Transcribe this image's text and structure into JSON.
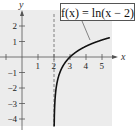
{
  "chart_data": {
    "type": "line",
    "title": "",
    "function_label": "f(x) = ln(x − 2)",
    "xlabel": "x",
    "ylabel": "y",
    "x_ticks": [
      1,
      2,
      3,
      4,
      5
    ],
    "y_ticks": [
      2,
      1,
      -1,
      -2,
      -3,
      -4
    ],
    "x_tick_labels": [
      "1",
      "2",
      "3",
      "4",
      "5"
    ],
    "y_tick_labels": [
      "2",
      "1",
      "−1",
      "−2",
      "−3",
      "−4"
    ],
    "xlim": [
      -1.3,
      5.6
    ],
    "ylim": [
      -4.5,
      3.0
    ],
    "asymptote": {
      "x": 2,
      "style": "dashed"
    },
    "grid": false,
    "series": [
      {
        "name": "f(x) = ln(x − 2)",
        "x": [
          2.011,
          2.05,
          2.1,
          2.2,
          2.4,
          2.6,
          3,
          3.5,
          4,
          4.5,
          5,
          5.5
        ],
        "y": [
          -4.5,
          -3.0,
          -2.3,
          -1.61,
          -0.92,
          -0.51,
          0,
          0.41,
          0.69,
          0.92,
          1.1,
          1.25
        ]
      }
    ],
    "colors": {
      "background_shade": "#ececec",
      "curve": "#111111",
      "axes": "#555555"
    }
  }
}
